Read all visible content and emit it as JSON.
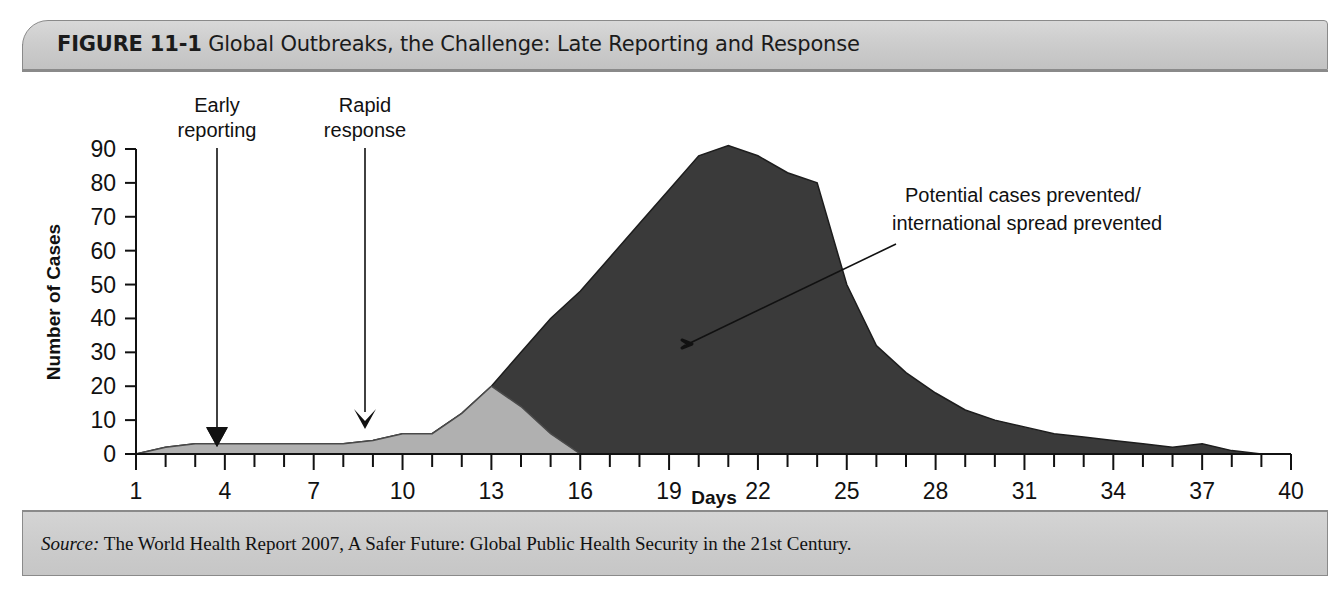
{
  "figure": {
    "number_label": "FIGURE 11-1",
    "title": "Global Outbreaks, the Challenge: Late Reporting and Response",
    "source_label": "Source:",
    "source_text": " The World Health Report 2007, A Safer Future: Global Public Health Security in the 21st Century."
  },
  "colors": {
    "late_response_fill": "#3a3a3a",
    "early_response_fill": "#b0b0b0",
    "axis": "#111111",
    "header_bg": "#cdcdcd",
    "frame": "#8a8a8a"
  },
  "annotations": {
    "early_reporting": {
      "line1": "Early",
      "line2": "reporting",
      "day": 4
    },
    "rapid_response": {
      "line1": "Rapid",
      "line2": "response",
      "day": 9
    },
    "prevented": {
      "line1": "Potential cases prevented/",
      "line2": "international spread prevented"
    }
  },
  "chart_data": {
    "type": "area",
    "title": "Global Outbreaks, the Challenge: Late Reporting and Response",
    "xlabel": "Days",
    "ylabel": "Number of Cases",
    "xlim": [
      1,
      40
    ],
    "ylim": [
      0,
      90
    ],
    "xticks": [
      1,
      4,
      7,
      10,
      13,
      16,
      19,
      22,
      25,
      28,
      31,
      34,
      37,
      40
    ],
    "yticks": [
      0,
      10,
      20,
      30,
      40,
      50,
      60,
      70,
      80,
      90
    ],
    "minor_x_tick_step": 1,
    "grid": false,
    "legend": "none",
    "x": [
      1,
      2,
      3,
      4,
      5,
      6,
      7,
      8,
      9,
      10,
      11,
      12,
      13,
      14,
      15,
      16,
      17,
      18,
      19,
      20,
      21,
      22,
      23,
      24,
      25,
      26,
      27,
      28,
      29,
      30,
      31,
      32,
      33,
      34,
      35,
      36,
      37,
      38,
      39,
      40
    ],
    "series": [
      {
        "name": "Late reporting and response (actual outbreak curve)",
        "fill": "#3a3a3a",
        "values": [
          0,
          2,
          3,
          3,
          3,
          3,
          3,
          3,
          4,
          6,
          6,
          12,
          20,
          30,
          40,
          48,
          58,
          68,
          78,
          88,
          91,
          88,
          83,
          80,
          50,
          32,
          24,
          18,
          13,
          10,
          8,
          6,
          5,
          4,
          3,
          2,
          3,
          1,
          0,
          0
        ]
      },
      {
        "name": "Early reporting and rapid response (contained curve)",
        "fill": "#b0b0b0",
        "values": [
          0,
          2,
          3,
          3,
          3,
          3,
          3,
          3,
          4,
          6,
          6,
          12,
          20,
          14,
          6,
          0,
          0,
          0,
          0,
          0,
          0,
          0,
          0,
          0,
          0,
          0,
          0,
          0,
          0,
          0,
          0,
          0,
          0,
          0,
          0,
          0,
          0,
          0,
          0,
          0
        ]
      }
    ],
    "annotation_points": [
      {
        "label": "Early reporting",
        "day": 4,
        "value": 3
      },
      {
        "label": "Rapid response",
        "day": 9,
        "value": 4
      },
      {
        "label": "Potential cases prevented/international spread prevented",
        "day": 19.5,
        "value": 33
      }
    ]
  }
}
